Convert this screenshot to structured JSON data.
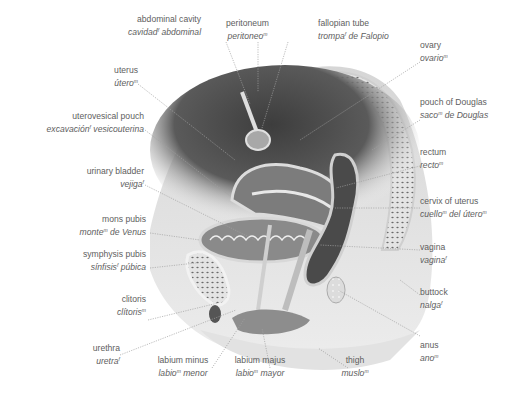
{
  "diagram": {
    "style": {
      "label_color": "#5e5e5e",
      "leader_color": "#9a9a9a",
      "background": "#ffffff"
    },
    "labels": [
      {
        "id": "abdominal-cavity",
        "en": "abdominal cavity",
        "es": "cavidad",
        "gender": "f",
        "es_rest": " abdominal"
      },
      {
        "id": "peritoneum",
        "en": "peritoneum",
        "es": "peritoneo",
        "gender": "m",
        "es_rest": ""
      },
      {
        "id": "fallopian-tube",
        "en": "fallopian tube",
        "es": "trompa",
        "gender": "f",
        "es_rest": " de Falopio"
      },
      {
        "id": "ovary",
        "en": "ovary",
        "es": "ovario",
        "gender": "m",
        "es_rest": ""
      },
      {
        "id": "uterus",
        "en": "uterus",
        "es": "útero",
        "gender": "m",
        "es_rest": ""
      },
      {
        "id": "uterovesical-pouch",
        "en": "uterovesical pouch",
        "es": "excavación",
        "gender": "f",
        "es_rest": " vesicouterina"
      },
      {
        "id": "pouch-of-douglas",
        "en": "pouch of Douglas",
        "es": "saco",
        "gender": "m",
        "es_rest": " de Douglas"
      },
      {
        "id": "urinary-bladder",
        "en": "urinary bladder",
        "es": "vejiga",
        "gender": "f",
        "es_rest": ""
      },
      {
        "id": "rectum",
        "en": "rectum",
        "es": "recto",
        "gender": "m",
        "es_rest": ""
      },
      {
        "id": "mons-pubis",
        "en": "mons pubis",
        "es": "monte",
        "gender": "m",
        "es_rest": " de Venus"
      },
      {
        "id": "cervix-of-uterus",
        "en": "cervix of uterus",
        "es": "cuello",
        "gender": "m",
        "es_rest": " del útero",
        "gender2": "m"
      },
      {
        "id": "symphysis-pubis",
        "en": "symphysis pubis",
        "es": "sínfisis",
        "gender": "f",
        "es_rest": " púbica"
      },
      {
        "id": "vagina",
        "en": "vagina",
        "es": "vagina",
        "gender": "f",
        "es_rest": ""
      },
      {
        "id": "clitoris",
        "en": "clitoris",
        "es": "clítoris",
        "gender": "m",
        "es_rest": ""
      },
      {
        "id": "buttock",
        "en": "buttock",
        "es": "nalga",
        "gender": "f",
        "es_rest": ""
      },
      {
        "id": "urethra",
        "en": "urethra",
        "es": "uretra",
        "gender": "f",
        "es_rest": ""
      },
      {
        "id": "anus",
        "en": "anus",
        "es": "ano",
        "gender": "m",
        "es_rest": ""
      },
      {
        "id": "labium-minus",
        "en": "labium minus",
        "es": "labio",
        "gender": "m",
        "es_rest": " menor"
      },
      {
        "id": "labium-majus",
        "en": "labium majus",
        "es": "labio",
        "gender": "m",
        "es_rest": " mayor"
      },
      {
        "id": "thigh",
        "en": "thigh",
        "es": "muslo",
        "gender": "m",
        "es_rest": ""
      }
    ]
  }
}
